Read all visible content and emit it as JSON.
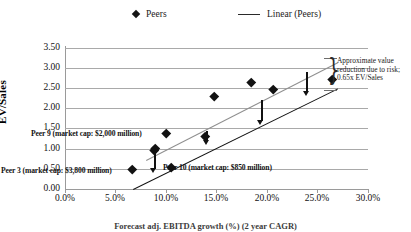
{
  "chart_data": {
    "type": "scatter",
    "title": "",
    "xlabel": "Forecast adj. EBITDA growth (%) (2 year CAGR)",
    "ylabel": "EV/Sales",
    "xlim": [
      0,
      30
    ],
    "ylim": [
      0,
      3.5
    ],
    "x_tick_labels": [
      "0.0%",
      "5.0%",
      "10.0%",
      "15.0%",
      "20.0%",
      "25.0%",
      "30.0%"
    ],
    "x_ticks": [
      0,
      5,
      10,
      15,
      20,
      25,
      30
    ],
    "y_tick_labels": [
      "0.00",
      "0.50",
      "1.00",
      "1.50",
      "2.00",
      "2.50",
      "3.00",
      "3.50"
    ],
    "y_ticks": [
      0,
      0.5,
      1,
      1.5,
      2,
      2.5,
      3,
      3.5
    ],
    "grid": true,
    "legend_position": "top",
    "legend": [
      {
        "label": "Peers",
        "marker": "diamond",
        "color": "#121212"
      },
      {
        "label": "Linear (Peers)",
        "marker": "line",
        "color": "#2a2a2a"
      }
    ],
    "series": [
      {
        "name": "Peers",
        "marker": "diamond",
        "points": [
          {
            "x": 6.7,
            "y": 0.5
          },
          {
            "x": 8.8,
            "y": 0.95
          },
          {
            "x": 8.9,
            "y": 1.02
          },
          {
            "x": 10.0,
            "y": 1.38
          },
          {
            "x": 10.5,
            "y": 0.55
          },
          {
            "x": 13.9,
            "y": 1.32
          },
          {
            "x": 14.8,
            "y": 2.3
          },
          {
            "x": 18.4,
            "y": 2.66
          },
          {
            "x": 20.6,
            "y": 2.47
          },
          {
            "x": 26.5,
            "y": 2.72
          }
        ]
      }
    ],
    "trendlines": [
      {
        "name": "Linear (Peers)",
        "color": "#8f8f8f",
        "x_start": 8.0,
        "y_start": 0.72,
        "x_end": 27.0,
        "y_end": 3.15
      },
      {
        "name": "Risk-adjusted line",
        "color": "#121212",
        "x_start": 6.7,
        "y_start": 0.0,
        "x_end": 27.0,
        "y_end": 2.5
      }
    ],
    "arrows": [
      {
        "x": 8.8,
        "y_from": 0.95,
        "y_to": 0.4
      },
      {
        "x": 14.0,
        "y_from": 1.45,
        "y_to": 1.08
      },
      {
        "x": 19.4,
        "y_from": 2.2,
        "y_to": 1.6
      },
      {
        "x": 23.9,
        "y_from": 2.9,
        "y_to": 2.3
      }
    ],
    "annotations": [
      {
        "id": "peer-9",
        "text": "Peer 9 (market cap: $2,000 million)"
      },
      {
        "id": "peer-3",
        "text": "Peer 3 (market cap: $3,800 million)"
      },
      {
        "id": "peer-10",
        "text": "Peer 10 (market cap: $850 million)"
      },
      {
        "id": "risk-brace",
        "text": "Approximate value reduction due to risk; 0.65x EV/Sales"
      }
    ]
  },
  "legend": {
    "peers_label": "Peers",
    "linear_label": "Linear (Peers)"
  },
  "axes": {
    "y_title": "EV/Sales",
    "x_title": "Forecast adj. EBITDA growth (%) (2 year CAGR)",
    "y_labels": [
      "3.50",
      "3.00",
      "2.50",
      "2.00",
      "1.50",
      "1.00",
      "0.50",
      "0.00"
    ],
    "x_labels": [
      "0.0%",
      "5.0%",
      "10.0%",
      "15.0%",
      "20.0%",
      "25.0%",
      "30.0%"
    ]
  },
  "annotations": {
    "peer9": "Peer 9 (market cap: $2,000 million)",
    "peer3": "Peer 3 (market cap: $3,800 million)",
    "peer10": "Peer 10 (market cap: $850 million)",
    "risk_note": "Approximate value reduction due to risk; 0.65x EV/Sales"
  },
  "colors": {
    "marker": "#121212",
    "trend_upper": "#8f8f8f",
    "trend_lower": "#121212",
    "grid": "#a9a9a9",
    "text": "#111111"
  }
}
